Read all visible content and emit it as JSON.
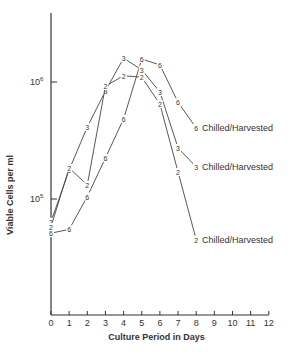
{
  "chart_data": {
    "type": "line",
    "title": "",
    "xlabel": "Culture Period in Days",
    "ylabel": "Viable Cells per ml",
    "yscale": "log",
    "xlim": [
      0,
      12
    ],
    "ylim": [
      10000,
      4000000
    ],
    "x_ticks": [
      0,
      1,
      2,
      3,
      4,
      5,
      6,
      7,
      8,
      9,
      10,
      11,
      12
    ],
    "y_ticks": [
      {
        "value": 100000,
        "label": "10^5"
      },
      {
        "value": 1000000,
        "label": "10^6"
      }
    ],
    "grid": false,
    "x": [
      0,
      1,
      2,
      3,
      4,
      5,
      6,
      7,
      8
    ],
    "series": [
      {
        "name": "6",
        "marker": "6",
        "end_label": "Chilled/Harvested",
        "values": [
          51000,
          55000,
          105000,
          224000,
          484000,
          1570000,
          1400000,
          670000,
          405000
        ]
      },
      {
        "name": "3",
        "marker": "3",
        "end_label": "Chilled/Harvested",
        "values": [
          64000,
          177000,
          413000,
          838000,
          1600000,
          1270000,
          822000,
          273000,
          188000
        ]
      },
      {
        "name": "2",
        "marker": "2",
        "end_label": "Chilled/Harvested",
        "values": [
          58000,
          184000,
          132000,
          924000,
          1130000,
          1100000,
          648000,
          170000,
          45000
        ]
      }
    ]
  },
  "labels": {
    "xlabel": "Culture Period in Days",
    "ylabel": "Viable Cells per ml",
    "y_tick_base": "10",
    "y_tick_6_exp": "6",
    "y_tick_5_exp": "5",
    "end_label_6": "Chilled/Harvested",
    "end_label_3": "Chilled/Harvested",
    "end_label_2": "Chilled/Harvested"
  }
}
